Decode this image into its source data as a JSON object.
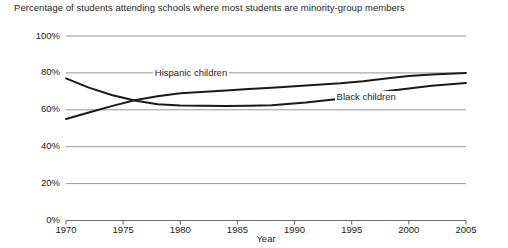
{
  "chart_data": {
    "type": "line",
    "title": "Percentage of students attending schools where most students are minority-group members",
    "xlabel": "Year",
    "ylabel": "",
    "xlim": [
      1970,
      2005
    ],
    "ylim": [
      0,
      100
    ],
    "grid": true,
    "legend_position": "inline-annotations",
    "xticks": [
      "1970",
      "1975",
      "1980",
      "1985",
      "1990",
      "1995",
      "2000",
      "2005"
    ],
    "xtick_values": [
      1970,
      1975,
      1980,
      1985,
      1990,
      1995,
      2000,
      2005
    ],
    "yticks": [
      "0%",
      "20%",
      "40%",
      "60%",
      "80%",
      "100%"
    ],
    "ytick_values": [
      0,
      20,
      40,
      60,
      80,
      100
    ],
    "x": [
      1970,
      1972,
      1974,
      1976,
      1978,
      1980,
      1984,
      1986,
      1988,
      1991,
      1994,
      1996,
      1998,
      2000,
      2002,
      2005
    ],
    "series": [
      {
        "name": "Black children",
        "color": "#1a1a1a",
        "values": [
          77.0,
          72.0,
          68.0,
          65.0,
          63.0,
          62.3,
          62.1,
          62.2,
          62.5,
          64.0,
          66.0,
          68.0,
          70.0,
          71.5,
          73.0,
          74.5
        ]
      },
      {
        "name": "Hispanic children",
        "color": "#1a1a1a",
        "values": [
          55.0,
          58.5,
          62.0,
          65.2,
          67.3,
          69.0,
          70.5,
          71.3,
          72.0,
          73.2,
          74.4,
          75.5,
          77.0,
          78.3,
          79.2,
          80.0
        ]
      }
    ],
    "annotations": [
      {
        "text": "Hispanic children",
        "x": 1977.6,
        "y": 79.5
      },
      {
        "text": "Black children",
        "x": 1993.5,
        "y": 66.5
      }
    ]
  }
}
